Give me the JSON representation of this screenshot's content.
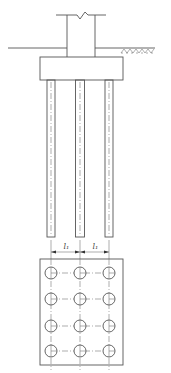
{
  "diagram": {
    "type": "pile-cap-foundation",
    "views": [
      "elevation",
      "plan"
    ],
    "colors": {
      "line": "#555555",
      "background": "#ffffff"
    },
    "elevation": {
      "column": {
        "x": 67,
        "width": 28,
        "top": 15,
        "bottom": 57,
        "break_line_y": 15
      },
      "ground_line_y": 48,
      "cap": {
        "x": 40,
        "y": 57,
        "width": 83,
        "height": 23
      },
      "piles": [
        {
          "center_x": 51,
          "width": 8,
          "top": 80,
          "bottom": 237
        },
        {
          "center_x": 80,
          "width": 9,
          "top": 80,
          "bottom": 237
        },
        {
          "center_x": 109,
          "width": 8,
          "top": 80,
          "bottom": 237
        }
      ]
    },
    "dimensions": {
      "y": 252,
      "spans": [
        {
          "from_x": 51,
          "to_x": 80,
          "label": "l₁"
        },
        {
          "from_x": 80,
          "to_x": 109,
          "label": "l₁"
        }
      ]
    },
    "plan": {
      "rect": {
        "x": 40,
        "y": 259,
        "width": 83,
        "height": 106
      },
      "columns_x": [
        51,
        80,
        109
      ],
      "rows_y": [
        273,
        299,
        326,
        351
      ],
      "pile_radius": 6
    }
  }
}
